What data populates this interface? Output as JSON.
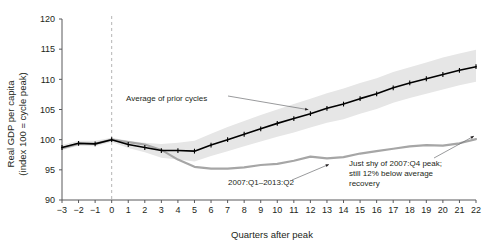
{
  "chart_data": {
    "type": "line",
    "title": "",
    "subtitle": "",
    "xlabel": "Quarters after peak",
    "ylabel": "Real GDP per capita\n(index 100 = cycle peak)",
    "ylabel_line1": "Real GDP per capita",
    "ylabel_line2": "(index 100 = cycle peak)",
    "xlim": [
      -3,
      22
    ],
    "ylim": [
      90,
      120
    ],
    "xticks": [
      "−3",
      "−2",
      "−1",
      "0",
      "1",
      "2",
      "3",
      "4",
      "5",
      "6",
      "7",
      "8",
      "9",
      "10",
      "11",
      "12",
      "13",
      "14",
      "15",
      "16",
      "17",
      "18",
      "19",
      "20",
      "21",
      "22"
    ],
    "yticks": [
      "90",
      "95",
      "100",
      "105",
      "110",
      "115",
      "120"
    ],
    "grid": false,
    "legend_position": "inline-annotations",
    "x": [
      -3,
      -2,
      -1,
      0,
      1,
      2,
      3,
      4,
      5,
      6,
      7,
      8,
      9,
      10,
      11,
      12,
      13,
      14,
      15,
      16,
      17,
      18,
      19,
      20,
      21,
      22
    ],
    "series": [
      {
        "name": "Average of prior cycles",
        "color": "#000000",
        "style": "line-with-markers",
        "values": [
          98.7,
          99.4,
          99.3,
          100.0,
          99.2,
          98.7,
          98.2,
          98.2,
          98.1,
          99.1,
          100.0,
          100.9,
          101.8,
          102.7,
          103.5,
          104.3,
          105.2,
          105.9,
          106.8,
          107.6,
          108.6,
          109.4,
          110.1,
          110.8,
          111.5,
          112.1
        ]
      },
      {
        "name": "2007:Q1–2013:Q2",
        "color": "#a6a6a6",
        "style": "line",
        "values": [
          98.6,
          99.3,
          99.3,
          100.0,
          99.6,
          99.2,
          98.3,
          96.7,
          95.5,
          95.2,
          95.2,
          95.4,
          95.8,
          96.0,
          96.5,
          97.2,
          96.9,
          97.1,
          97.7,
          98.1,
          98.5,
          98.9,
          99.1,
          99.0,
          99.4,
          100.1
        ]
      },
      {
        "name": "Range around average of prior cycles (upper)",
        "color": "#e6e6e6",
        "style": "band-upper",
        "values": [
          99.1,
          99.8,
          99.8,
          100.3,
          99.8,
          99.5,
          99.3,
          99.5,
          99.8,
          101.0,
          102.1,
          103.1,
          104.1,
          105.0,
          105.9,
          106.8,
          107.7,
          108.5,
          109.4,
          110.2,
          111.2,
          112.0,
          112.8,
          113.6,
          114.3,
          114.9
        ]
      },
      {
        "name": "Range around average of prior cycles (lower)",
        "color": "#e6e6e6",
        "style": "band-lower",
        "values": [
          98.3,
          99.0,
          98.9,
          99.6,
          98.6,
          97.9,
          97.0,
          96.7,
          96.4,
          97.3,
          98.1,
          98.9,
          99.7,
          100.5,
          101.2,
          102.0,
          102.8,
          103.4,
          104.3,
          105.1,
          106.1,
          106.9,
          107.6,
          108.3,
          109.0,
          109.6
        ]
      }
    ],
    "annotations": [
      {
        "id": "avg-prior-cycles",
        "text": "Average of prior cycles",
        "points_to_x": 12,
        "points_to_y": 104.3
      },
      {
        "id": "current-cycle",
        "text": "2007:Q1–2013:Q2",
        "points_to_x": 13,
        "points_to_y": 96.9
      },
      {
        "id": "shortfall",
        "text_line1": "Just shy of 2007:Q4 peak;",
        "text_line2": "still 12% below average",
        "text_line3": "recovery",
        "points_to_x": 22,
        "points_to_y": 100.1
      }
    ],
    "reference_lines": [
      {
        "id": "peak-marker",
        "orientation": "vertical",
        "x": 0,
        "style": "dashed",
        "color": "#b5b5b5"
      }
    ]
  }
}
